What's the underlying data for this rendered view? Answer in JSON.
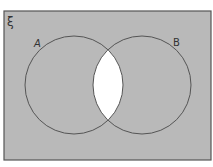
{
  "diagram": {
    "type": "venn",
    "universal_symbol": "ξ",
    "sets": [
      {
        "name": "A",
        "label": "A"
      },
      {
        "name": "B",
        "label": "B"
      }
    ],
    "shaded_region": "(A ∩ B)'",
    "unshaded_region": "A ∩ B",
    "colors": {
      "shade": "#b9b9b9",
      "unshaded": "#ffffff",
      "outline": "#555555",
      "background": "#ffffff"
    }
  }
}
